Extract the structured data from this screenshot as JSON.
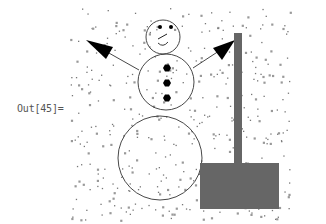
{
  "cell": {
    "output_label": "Out[45]="
  },
  "graphic": {
    "description": "Snowman with arms, hexagon buttons, a signpost and falling snow",
    "colors": {
      "outline": "#333333",
      "arrow": "#000000",
      "post": "#666666",
      "snow": "#888888",
      "buttons": "#000000"
    },
    "head": {
      "cx": 163,
      "cy": 37,
      "r": 17
    },
    "middle": {
      "cx": 166,
      "cy": 82,
      "r": 28
    },
    "bottom": {
      "cx": 160,
      "cy": 158,
      "r": 42
    },
    "buttons": [
      {
        "cx": 167,
        "cy": 68
      },
      {
        "cx": 167,
        "cy": 83
      },
      {
        "cx": 167,
        "cy": 98
      }
    ],
    "left_arm": {
      "x1": 139,
      "y1": 70,
      "x2": 86,
      "y2": 40
    },
    "right_arm": {
      "x1": 193,
      "y1": 68,
      "x2": 235,
      "y2": 40
    },
    "post": {
      "x": 234,
      "y": 33,
      "w": 8,
      "h": 131
    },
    "box": {
      "x": 200,
      "y": 163,
      "w": 79,
      "h": 46
    }
  }
}
